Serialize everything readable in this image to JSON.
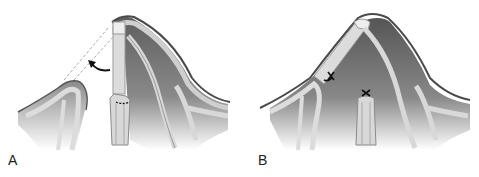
{
  "figure": {
    "panels": [
      {
        "id": "A",
        "label": "A",
        "description": "Osteotomized segment with dashed outline showing repositioning; curved arrow indicates rotation; dotted line marks cut site"
      },
      {
        "id": "B",
        "label": "B",
        "description": "Segment repositioned and fixed with sutures (x marks)"
      }
    ],
    "colors": {
      "bone_light": "#e6e6e6",
      "bone_mid": "#bdbdbd",
      "shadow_dark": "#6e6e6e",
      "outline": "#555555",
      "annotation": "#111111",
      "dashed": "#aaaaaa"
    }
  }
}
